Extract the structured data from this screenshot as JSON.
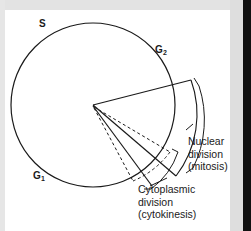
{
  "figure": {
    "type": "cell-cycle-diagram",
    "title_visible": false,
    "background_color": "#ffffff",
    "line_color": "#1a1a1a",
    "frame": {
      "top_band_color": "#e3e3e3",
      "left_band_color": "#e6e6e6",
      "right_band_color": "#dedede",
      "right_edge_color": "#111111"
    }
  },
  "phases": [
    {
      "id": "s",
      "label": "S",
      "subscript": ""
    },
    {
      "id": "g2",
      "label": "G",
      "subscript": "2"
    },
    {
      "id": "g1",
      "label": "G",
      "subscript": "1"
    }
  ],
  "callouts": [
    {
      "id": "nuclear-division",
      "lines": [
        "Nuclear",
        "division",
        "(mitosis)"
      ]
    },
    {
      "id": "cytoplasmic-division",
      "lines": [
        "Cytoplasmic",
        "division",
        "(cytokinesis)"
      ]
    }
  ],
  "geometry": {
    "circle": {
      "cx": 93,
      "cy": 105,
      "r": 82
    },
    "wedge_apex": {
      "x": 93,
      "y": 105
    }
  }
}
